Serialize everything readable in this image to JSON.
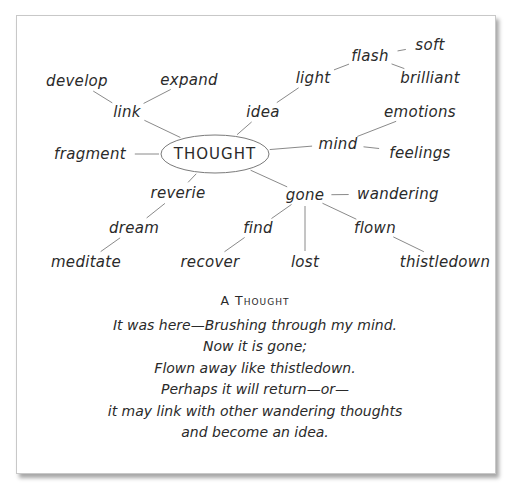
{
  "diagram": {
    "center": {
      "id": "thought",
      "label": "THOUGHT",
      "x": 215,
      "y": 154
    },
    "nodes": [
      {
        "id": "develop",
        "label": "develop",
        "x": 77,
        "y": 81
      },
      {
        "id": "expand",
        "label": "expand",
        "x": 189,
        "y": 80
      },
      {
        "id": "link",
        "label": "link",
        "x": 127,
        "y": 112
      },
      {
        "id": "idea",
        "label": "idea",
        "x": 263,
        "y": 112
      },
      {
        "id": "light",
        "label": "light",
        "x": 313,
        "y": 78
      },
      {
        "id": "flash",
        "label": "flash",
        "x": 370,
        "y": 56
      },
      {
        "id": "soft",
        "label": "soft",
        "x": 430,
        "y": 45
      },
      {
        "id": "brilliant",
        "label": "brilliant",
        "x": 430,
        "y": 78
      },
      {
        "id": "emotions",
        "label": "emotions",
        "x": 420,
        "y": 112
      },
      {
        "id": "mind",
        "label": "mind",
        "x": 338,
        "y": 144
      },
      {
        "id": "feelings",
        "label": "feelings",
        "x": 420,
        "y": 153
      },
      {
        "id": "fragment",
        "label": "fragment",
        "x": 90,
        "y": 154
      },
      {
        "id": "reverie",
        "label": "reverie",
        "x": 178,
        "y": 193
      },
      {
        "id": "gone",
        "label": "gone",
        "x": 305,
        "y": 195
      },
      {
        "id": "wandering",
        "label": "wandering",
        "x": 398,
        "y": 194
      },
      {
        "id": "dream",
        "label": "dream",
        "x": 134,
        "y": 228
      },
      {
        "id": "find",
        "label": "find",
        "x": 258,
        "y": 228
      },
      {
        "id": "flown",
        "label": "flown",
        "x": 375,
        "y": 228
      },
      {
        "id": "meditate",
        "label": "meditate",
        "x": 86,
        "y": 262
      },
      {
        "id": "recover",
        "label": "recover",
        "x": 210,
        "y": 262
      },
      {
        "id": "lost",
        "label": "lost",
        "x": 305,
        "y": 262
      },
      {
        "id": "thistledown",
        "label": "thistledown",
        "x": 445,
        "y": 262
      }
    ],
    "edges": [
      [
        "thought",
        "link"
      ],
      [
        "link",
        "develop"
      ],
      [
        "link",
        "expand"
      ],
      [
        "thought",
        "idea"
      ],
      [
        "idea",
        "light"
      ],
      [
        "light",
        "flash"
      ],
      [
        "flash",
        "soft"
      ],
      [
        "flash",
        "brilliant"
      ],
      [
        "thought",
        "mind"
      ],
      [
        "mind",
        "emotions"
      ],
      [
        "mind",
        "feelings"
      ],
      [
        "thought",
        "fragment"
      ],
      [
        "thought",
        "reverie"
      ],
      [
        "reverie",
        "dream"
      ],
      [
        "dream",
        "meditate"
      ],
      [
        "thought",
        "gone"
      ],
      [
        "gone",
        "wandering"
      ],
      [
        "gone",
        "find"
      ],
      [
        "find",
        "recover"
      ],
      [
        "gone",
        "lost"
      ],
      [
        "gone",
        "flown"
      ],
      [
        "flown",
        "thistledown"
      ]
    ]
  },
  "poem": {
    "title": "A Thought",
    "lines": [
      "It was here—Brushing through my mind.",
      "Now it is gone;",
      "Flown away like thistledown.",
      "Perhaps it will return—or—",
      "it may link with other wandering thoughts",
      "and become an idea."
    ]
  },
  "colors": {
    "ink": "#2a2a2a",
    "line": "#7a7a7a",
    "frame_border": "#c8c8c8"
  }
}
